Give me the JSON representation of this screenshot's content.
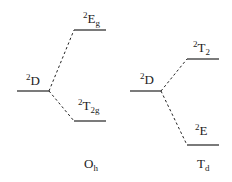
{
  "diagram": {
    "title": "",
    "type": "crystal field splitting of 2D term",
    "colors": {
      "line": "#222222",
      "text": "#222222",
      "background": "#ffffff"
    },
    "panels": [
      {
        "symmetry": {
          "main": "O",
          "sub": "h"
        },
        "free_ion": {
          "sup": "2",
          "main": "D",
          "sub": ""
        },
        "upper": {
          "sup": "2",
          "main": "E",
          "sub": "g"
        },
        "lower": {
          "sup": "2",
          "main": "T",
          "sub": "2g"
        }
      },
      {
        "symmetry": {
          "main": "T",
          "sub": "d"
        },
        "free_ion": {
          "sup": "2",
          "main": "D",
          "sub": ""
        },
        "upper": {
          "sup": "2",
          "main": "T",
          "sub": "2"
        },
        "lower": {
          "sup": "2",
          "main": "E",
          "sub": ""
        }
      }
    ]
  }
}
